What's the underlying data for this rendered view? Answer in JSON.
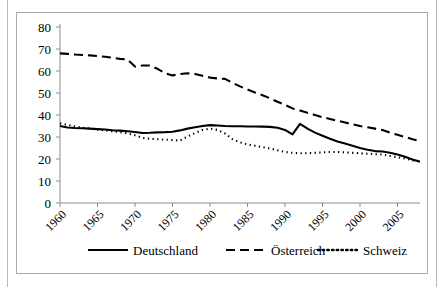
{
  "chart_data": {
    "type": "line",
    "title": "",
    "subtitle": "",
    "xlabel": "",
    "ylabel": "",
    "xlim": [
      1960,
      2008
    ],
    "ylim": [
      0,
      80
    ],
    "grid": false,
    "legend_position": "bottom",
    "y_ticks": [
      "0",
      "10",
      "20",
      "30",
      "40",
      "50",
      "60",
      "70",
      "80"
    ],
    "x_ticks": [
      "1960",
      "1965",
      "1970",
      "1975",
      "1980",
      "1985",
      "1990",
      "1995",
      "2000",
      "2005"
    ],
    "x": [
      1960,
      1961,
      1962,
      1963,
      1964,
      1965,
      1966,
      1967,
      1968,
      1969,
      1970,
      1971,
      1972,
      1973,
      1974,
      1975,
      1976,
      1977,
      1978,
      1979,
      1980,
      1981,
      1982,
      1983,
      1984,
      1985,
      1986,
      1987,
      1988,
      1989,
      1990,
      1991,
      1992,
      1993,
      1994,
      1995,
      1996,
      1997,
      1998,
      1999,
      2000,
      2001,
      2002,
      2003,
      2004,
      2005,
      2006,
      2007,
      2008
    ],
    "series": [
      {
        "name": "Deutschland",
        "style": "solid",
        "color": "#000000",
        "values": [
          35.0,
          34.3,
          34.1,
          34.0,
          33.8,
          33.6,
          33.4,
          33.1,
          32.9,
          32.6,
          32.3,
          31.8,
          31.9,
          32.1,
          32.2,
          32.4,
          33.0,
          33.8,
          34.4,
          35.0,
          35.4,
          35.2,
          35.0,
          34.9,
          34.9,
          34.8,
          34.8,
          34.7,
          34.6,
          34.2,
          33.2,
          31.2,
          36.0,
          33.8,
          32.0,
          30.6,
          29.2,
          28.0,
          27.0,
          26.0,
          25.0,
          24.2,
          23.6,
          23.4,
          22.8,
          22.0,
          21.0,
          19.8,
          18.8
        ]
      },
      {
        "name": "Österreich",
        "style": "dashed",
        "color": "#000000",
        "values": [
          68.0,
          67.8,
          67.5,
          67.3,
          67.1,
          66.8,
          66.5,
          66.0,
          65.5,
          65.2,
          62.0,
          62.5,
          62.5,
          61.0,
          59.0,
          58.0,
          58.6,
          59.0,
          58.6,
          57.8,
          57.0,
          56.6,
          56.4,
          54.6,
          53.0,
          51.6,
          50.2,
          49.0,
          47.6,
          46.0,
          44.6,
          43.0,
          42.0,
          41.0,
          40.0,
          39.0,
          38.2,
          37.4,
          36.6,
          35.8,
          35.0,
          34.4,
          33.8,
          33.2,
          32.0,
          31.0,
          30.0,
          29.0,
          28.2
        ]
      },
      {
        "name": "Schweiz",
        "style": "dotted",
        "color": "#000000",
        "values": [
          36.2,
          35.5,
          34.8,
          34.2,
          33.8,
          33.4,
          33.0,
          32.6,
          32.2,
          31.6,
          30.8,
          29.6,
          29.2,
          29.0,
          28.8,
          28.6,
          28.4,
          30.2,
          31.8,
          33.2,
          33.8,
          33.2,
          31.6,
          29.0,
          27.6,
          26.6,
          26.0,
          25.4,
          24.8,
          24.0,
          23.2,
          22.8,
          22.6,
          22.6,
          22.8,
          23.0,
          23.2,
          23.2,
          23.0,
          22.8,
          22.6,
          22.4,
          22.2,
          22.0,
          21.4,
          20.8,
          20.2,
          19.4,
          19.0
        ]
      }
    ]
  },
  "legend": {
    "items": [
      {
        "label": "Deutschland",
        "style": "solid"
      },
      {
        "label": "Österreich",
        "style": "dashed"
      },
      {
        "label": "Schweiz",
        "style": "dotted"
      }
    ]
  }
}
